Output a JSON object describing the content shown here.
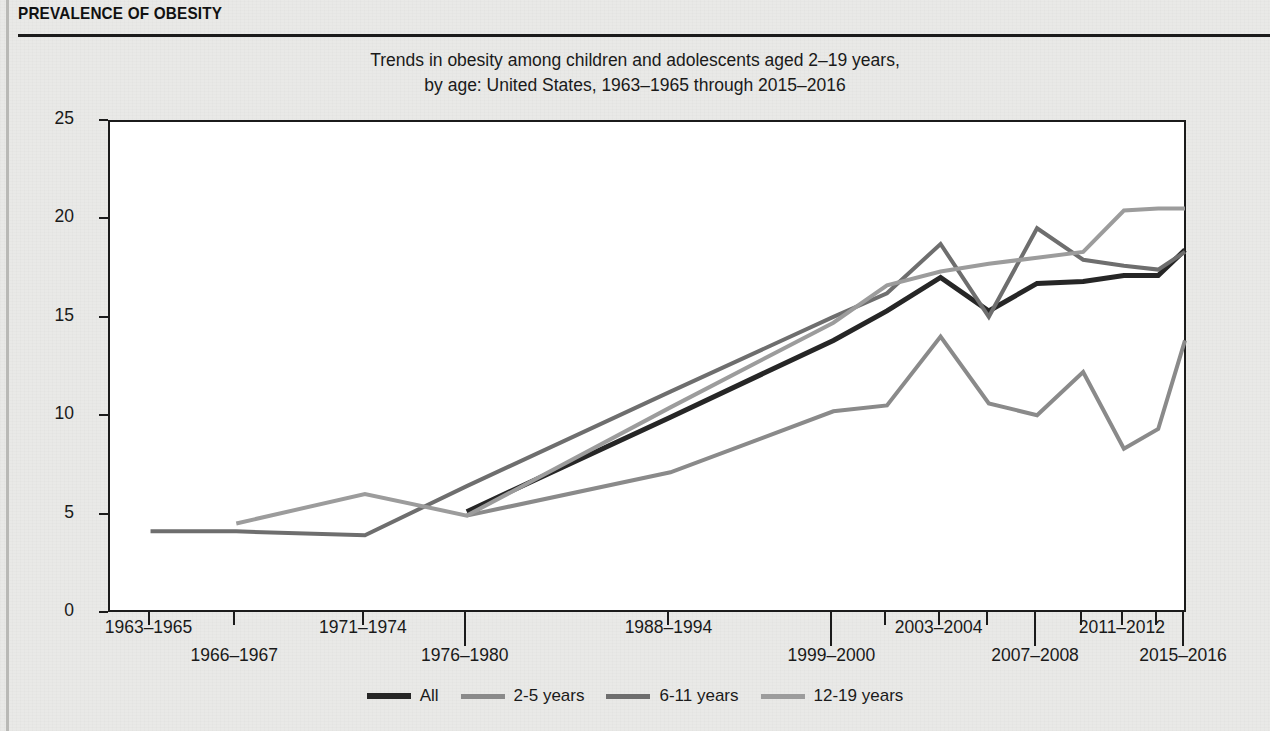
{
  "header": {
    "title": "PREVALENCE OF OBESITY"
  },
  "chart_data": {
    "type": "line",
    "title": "Trends in obesity among children and adolescents aged 2–19 years, by age: United States, 1963–1965 through 2015–2016",
    "title_line1": "Trends in obesity among children and adolescents aged 2–19 years,",
    "title_line2": "by age: United States, 1963–1965 through 2015–2016",
    "xlabel": "",
    "ylabel": "Percent",
    "ylim": [
      0,
      25
    ],
    "yticks": [
      0,
      5,
      10,
      15,
      20,
      25
    ],
    "grid": false,
    "legend_position": "bottom",
    "categories": [
      "1963–1965",
      "1966–1967",
      "1971–1974",
      "1976–1980",
      "1988–1994",
      "1999–2000",
      "2001–2002",
      "2003–2004",
      "2005–2006",
      "2007–2008",
      "2009–2010",
      "2011–2012",
      "2013–2014",
      "2015–2016"
    ],
    "tick_labels_shown": [
      {
        "label": "1963–1965",
        "row": 1,
        "category": "1963–1965",
        "tick": "short"
      },
      {
        "label": "1966–1967",
        "row": 2,
        "category": "1966–1967",
        "tick": "short"
      },
      {
        "label": "1971–1974",
        "row": 1,
        "category": "1971–1974",
        "tick": "short"
      },
      {
        "label": "1976–1980",
        "row": 2,
        "category": "1976–1980",
        "tick": "long"
      },
      {
        "label": "1988–1994",
        "row": 1,
        "category": "1988–1994",
        "tick": "short"
      },
      {
        "label": "1999–2000",
        "row": 2,
        "category": "1999–2000",
        "tick": "long"
      },
      {
        "label": "2003–2004",
        "row": 1,
        "category": "2003–2004",
        "tick": "short"
      },
      {
        "label": "2007–2008",
        "row": 2,
        "category": "2007–2008",
        "tick": "long"
      },
      {
        "label": "2011–2012",
        "row": 1,
        "category": "2011–2012",
        "tick": "short"
      },
      {
        "label": "2015–2016",
        "row": 2,
        "category": "2015–2016",
        "tick": "long"
      }
    ],
    "series": [
      {
        "name": "All",
        "color": "#262626",
        "width": 5,
        "start_index": 3,
        "values": [
          null,
          null,
          null,
          5.2,
          10.0,
          13.9,
          15.4,
          17.1,
          15.4,
          16.8,
          16.9,
          17.2,
          17.2,
          18.5
        ]
      },
      {
        "name": "2-5 years",
        "color": "#8a8a8a",
        "width": 4,
        "start_index": 3,
        "values": [
          null,
          null,
          null,
          5.0,
          7.2,
          10.3,
          10.6,
          14.1,
          10.7,
          10.1,
          12.3,
          8.4,
          9.4,
          13.9
        ]
      },
      {
        "name": "6-11 years",
        "color": "#6e6e6e",
        "width": 4,
        "start_index": 0,
        "values": [
          4.2,
          4.2,
          4.0,
          6.5,
          11.3,
          15.1,
          16.3,
          18.8,
          15.1,
          19.6,
          18.0,
          17.7,
          17.5,
          18.4
        ]
      },
      {
        "name": "12-19 years",
        "color": "#9c9c9c",
        "width": 4,
        "start_index": 1,
        "values": [
          null,
          4.6,
          6.1,
          5.0,
          10.5,
          14.8,
          16.7,
          17.4,
          17.8,
          18.1,
          18.4,
          20.5,
          20.6,
          20.6
        ]
      }
    ]
  },
  "legend": {
    "items": [
      {
        "label": "All",
        "color": "#262626"
      },
      {
        "label": "2-5 years",
        "color": "#8a8a8a"
      },
      {
        "label": "6-11 years",
        "color": "#6e6e6e"
      },
      {
        "label": "12-19 years",
        "color": "#9c9c9c"
      }
    ]
  }
}
